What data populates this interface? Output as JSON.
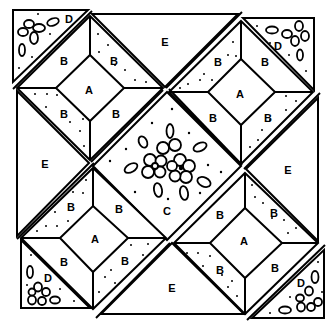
{
  "diagram": {
    "colors": {
      "line": "#000000",
      "background": "#ffffff"
    },
    "piece_labels": {
      "A": "A",
      "B": "B",
      "C": "C",
      "D": "D",
      "E": "E"
    },
    "blocks": [
      {
        "name": "top-left",
        "center_label": "A",
        "b_labels": [
          "B",
          "B",
          "B",
          "B"
        ]
      },
      {
        "name": "top-right",
        "center_label": "A",
        "b_labels": [
          "B",
          "B",
          "B",
          "B"
        ]
      },
      {
        "name": "bottom-left",
        "center_label": "A",
        "b_labels": [
          "B",
          "B",
          "B",
          "B"
        ]
      },
      {
        "name": "bottom-right",
        "center_label": "A",
        "b_labels": [
          "B",
          "B",
          "B",
          "B"
        ]
      }
    ],
    "center_square": {
      "label": "C",
      "motif": "flower-cluster"
    },
    "corner_triangles": [
      {
        "position": "top-left",
        "label": "D",
        "motif": "flower"
      },
      {
        "position": "top-right",
        "label": "D",
        "motif": "flower"
      },
      {
        "position": "bottom-left",
        "label": "D",
        "motif": "flower"
      },
      {
        "position": "bottom-right",
        "label": "D",
        "motif": "flower"
      }
    ],
    "side_triangles": [
      {
        "position": "top",
        "label": "E"
      },
      {
        "position": "left",
        "label": "E"
      },
      {
        "position": "right",
        "label": "E"
      },
      {
        "position": "bottom",
        "label": "E"
      }
    ]
  }
}
